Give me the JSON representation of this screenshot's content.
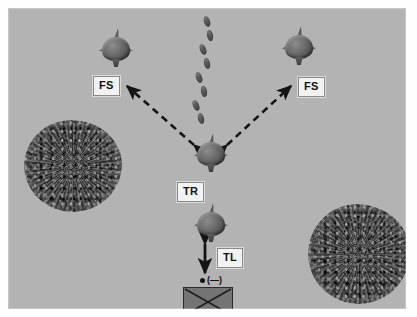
{
  "figure": {
    "background_color": "#b3b3b3",
    "page_color": "#ffffff",
    "label_box_color": "#f2f2f2",
    "ink_color": "#111111"
  },
  "labels": {
    "fs_left": "FS",
    "fs_right": "FS",
    "tr": "TR",
    "tl": "TL",
    "minus": "(—)"
  },
  "elements": {
    "molecule_fs_left": "molecule-fs-left",
    "molecule_fs_right": "molecule-fs-right",
    "molecule_tr": "molecule-tr",
    "molecule_tl": "molecule-tl",
    "cluster_left": "granular-cluster-left",
    "cluster_right": "granular-cluster-right",
    "crossed_box": "crossed-box",
    "particle_trail": "particle-trail"
  },
  "arrows": {
    "left_diagonal": "dashed double-headed arrow from TR to FS left",
    "right_diagonal": "dashed double-headed arrow from TR to FS right",
    "vertical": "solid double-headed arrow below TL"
  },
  "particles": [
    {
      "x": 196,
      "y": 8,
      "rot": -18
    },
    {
      "x": 199,
      "y": 22,
      "rot": -12
    },
    {
      "x": 192,
      "y": 36,
      "rot": -22
    },
    {
      "x": 196,
      "y": 50,
      "rot": -14
    },
    {
      "x": 188,
      "y": 64,
      "rot": -20
    },
    {
      "x": 193,
      "y": 78,
      "rot": -10
    },
    {
      "x": 185,
      "y": 92,
      "rot": -24
    },
    {
      "x": 190,
      "y": 105,
      "rot": -15
    }
  ]
}
